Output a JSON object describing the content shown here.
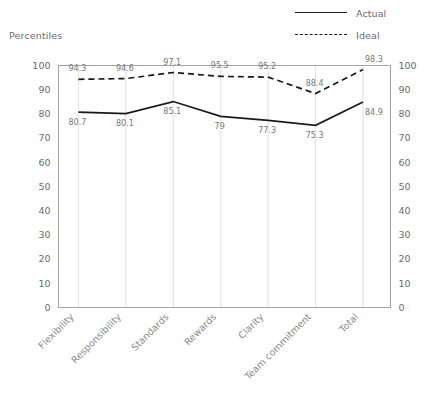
{
  "axis_title": "Percentiles",
  "legend": {
    "position": "top-right",
    "entries": [
      {
        "label": "Actual",
        "style": "solid",
        "color": "#1a1a1a"
      },
      {
        "label": "Ideal",
        "style": "dashed",
        "color": "#1a1a1a"
      }
    ]
  },
  "chart_data": {
    "type": "line",
    "title": "",
    "subtitle": "",
    "xlabel": "",
    "ylabel": "Percentiles",
    "ylim": [
      0,
      100
    ],
    "yticks": [
      0,
      10,
      20,
      30,
      40,
      50,
      60,
      70,
      80,
      90,
      100
    ],
    "ytick_labels": [
      "0",
      "10",
      "20",
      "30",
      "40",
      "50",
      "60",
      "70",
      "80",
      "90",
      "100"
    ],
    "right_axis_mirrored": true,
    "grid": {
      "vertical": true,
      "horizontal": false
    },
    "legend_position": "top-right",
    "categories": [
      "Flexibility",
      "Responsibility",
      "Standards",
      "Rewards",
      "Clarity",
      "Team commitment",
      "Total"
    ],
    "category_label_rotation": -45,
    "series": [
      {
        "name": "Actual",
        "style": "solid",
        "color": "#1a1a1a",
        "values": [
          80.7,
          80.1,
          85.1,
          79,
          77.3,
          75.3,
          84.9
        ],
        "labels": [
          "80.7",
          "80.1",
          "85.1",
          "79",
          "77.3",
          "75.3",
          "84.9"
        ],
        "label_position": "below"
      },
      {
        "name": "Ideal",
        "style": "dashed",
        "color": "#1a1a1a",
        "values": [
          94.3,
          94.6,
          97.1,
          95.5,
          95.2,
          88.4,
          98.3
        ],
        "labels": [
          "94.3",
          "94.6",
          "97.1",
          "95.5",
          "95.2",
          "88.4",
          "98.3"
        ],
        "label_position": "above"
      }
    ]
  }
}
